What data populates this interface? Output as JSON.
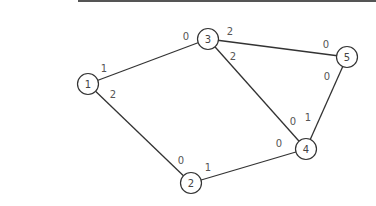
{
  "diagram": {
    "type": "graph",
    "nodes": [
      {
        "id": "1",
        "label": "1",
        "x": 88,
        "y": 84
      },
      {
        "id": "2",
        "label": "2",
        "x": 191,
        "y": 183
      },
      {
        "id": "3",
        "label": "3",
        "x": 208,
        "y": 39
      },
      {
        "id": "4",
        "label": "4",
        "x": 306,
        "y": 149
      },
      {
        "id": "5",
        "label": "5",
        "x": 347,
        "y": 57
      }
    ],
    "edges": [
      {
        "from": "1",
        "to": "3",
        "from_label": "1",
        "to_label": "0"
      },
      {
        "from": "1",
        "to": "2",
        "from_label": "2",
        "to_label": "0"
      },
      {
        "from": "3",
        "to": "5",
        "from_label": "2",
        "to_label": "0"
      },
      {
        "from": "3",
        "to": "4",
        "from_label": "2",
        "to_label": "0"
      },
      {
        "from": "5",
        "to": "4",
        "from_label": "0",
        "to_label": "1"
      },
      {
        "from": "2",
        "to": "4",
        "from_label": "1",
        "to_label": "0"
      }
    ]
  },
  "labels": {
    "e13_a": "1",
    "e13_b": "0",
    "e12_a": "2",
    "e12_b": "0",
    "e35_a": "2",
    "e35_b": "0",
    "e34_a": "2",
    "e34_b": "0",
    "e54_a": "0",
    "e54_b": "1",
    "e24_a": "1",
    "e24_b": "0",
    "n1": "1",
    "n2": "2",
    "n3": "3",
    "n4": "4",
    "n5": "5"
  },
  "colors": {
    "stroke": "#333333",
    "background": "#ffffff"
  }
}
